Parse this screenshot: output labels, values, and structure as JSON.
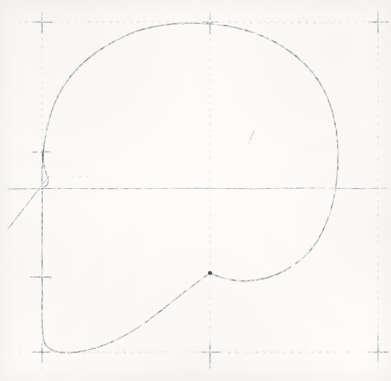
{
  "document": {
    "title": "Scanned Geometric Construction Drawing",
    "medium": "grayscale paper scan",
    "width_px": 391,
    "height_px": 381
  },
  "colors": {
    "paper": "#fdfcfa",
    "ink_dark": "#4a4a4c",
    "ink_mid": "#6e6e72",
    "guide_faint": "#c2c2c4",
    "guide_rule": "#8b8b8f"
  },
  "chart_data": {
    "type": "line",
    "title": "Scanned Geometric Construction Drawing",
    "xlabel": "",
    "ylabel": "",
    "xlim": [
      0,
      391
    ],
    "ylim": [
      381,
      0
    ],
    "grid": true,
    "legend": "none",
    "annotations": [
      "Large closed pear / P-bowl contour drawn in pencil-like stroke",
      "Faint dashed construction grid, 3 vertical and 3 horizontal guides",
      "Crosshair registration marks at grid intersections",
      "Straight diagonal ray crossing the lower-left guide intersection",
      "Small isolated diagonal tick near the interior right of center"
    ],
    "grid_lines": {
      "vertical_x": [
        42,
        210,
        378
      ],
      "horizontal_y": [
        22,
        188,
        352
      ]
    },
    "registration_marks": [
      {
        "name": "top-left",
        "x": 42,
        "y": 22
      },
      {
        "name": "top-center",
        "x": 210,
        "y": 22
      },
      {
        "name": "top-right",
        "x": 378,
        "y": 22
      },
      {
        "name": "mid-left",
        "x": 42,
        "y": 188
      },
      {
        "name": "bottom-left",
        "x": 42,
        "y": 352
      },
      {
        "name": "bottom-center",
        "x": 210,
        "y": 352
      },
      {
        "name": "bottom-right",
        "x": 378,
        "y": 352
      }
    ],
    "tick_marks": [
      {
        "name": "left-tick-upper",
        "x": 42,
        "y": 152
      },
      {
        "name": "left-tick-lower",
        "x": 42,
        "y": 277
      }
    ],
    "series": [
      {
        "name": "main-contour",
        "description": "closed pear shaped outline, sampled control points",
        "points": [
          [
            42,
            180
          ],
          [
            43,
            150
          ],
          [
            47,
            118
          ],
          [
            56,
            92
          ],
          [
            70,
            70
          ],
          [
            90,
            50
          ],
          [
            116,
            36
          ],
          [
            148,
            27
          ],
          [
            182,
            24
          ],
          [
            214,
            25
          ],
          [
            248,
            31
          ],
          [
            278,
            43
          ],
          [
            302,
            60
          ],
          [
            320,
            82
          ],
          [
            332,
            110
          ],
          [
            338,
            145
          ],
          [
            338,
            180
          ],
          [
            332,
            214
          ],
          [
            318,
            244
          ],
          [
            296,
            266
          ],
          [
            268,
            279
          ],
          [
            238,
            281
          ],
          [
            210,
            273
          ],
          [
            182,
            290
          ],
          [
            154,
            312
          ],
          [
            124,
            333
          ],
          [
            94,
            346
          ],
          [
            68,
            352
          ],
          [
            50,
            352
          ],
          [
            42,
            344
          ],
          [
            42,
            300
          ],
          [
            42,
            240
          ],
          [
            42,
            188
          ],
          [
            42,
            180
          ]
        ]
      },
      {
        "name": "diagonal-ray",
        "description": "straight ruled line entering from lower left",
        "points": [
          [
            8,
            228
          ],
          [
            48,
            177
          ]
        ]
      },
      {
        "name": "interior-tick",
        "description": "small faint diagonal stroke inside the bowl",
        "points": [
          [
            254,
            132
          ],
          [
            250,
            142
          ]
        ]
      }
    ]
  },
  "layers": {
    "guides_label": "construction-guides",
    "contour_label": "main-contour",
    "marks_label": "registration-marks"
  }
}
